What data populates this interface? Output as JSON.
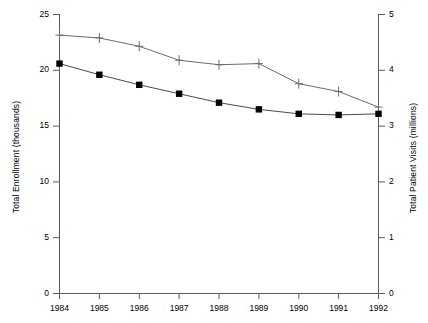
{
  "chart_data": {
    "type": "line",
    "title": "",
    "xlabel": "",
    "categories": [
      "1984",
      "1985",
      "1986",
      "1987",
      "1988",
      "1989",
      "1990",
      "1991",
      "1992"
    ],
    "x": [
      1984,
      1985,
      1986,
      1987,
      1988,
      1989,
      1990,
      1991,
      1992
    ],
    "grid": false,
    "legend_position": "none",
    "series": [
      {
        "name": "Total Patient Visits (millions)",
        "marker": "plus",
        "axis": "right",
        "color": "#555555",
        "values": [
          4.63,
          4.58,
          4.43,
          4.18,
          4.1,
          4.12,
          3.76,
          3.62,
          3.34
        ]
      },
      {
        "name": "Total Enrollment (thousands)",
        "marker": "filled-square",
        "axis": "left",
        "color": "#000000",
        "values": [
          20.6,
          19.6,
          18.7,
          17.9,
          17.1,
          16.5,
          16.1,
          16.0,
          16.1
        ]
      }
    ],
    "axes": {
      "left": {
        "label": "Total Enrollment (thousands)",
        "ticks": [
          "0",
          "5",
          "10",
          "15",
          "20",
          "25"
        ],
        "tick_values": [
          0,
          5,
          10,
          15,
          20,
          25
        ],
        "ylim": [
          0,
          25
        ]
      },
      "right": {
        "label": "Total Patient Visits (millions)",
        "ticks": [
          "0",
          "1",
          "2",
          "3",
          "4",
          "5"
        ],
        "tick_values": [
          0,
          1,
          2,
          3,
          4,
          5
        ],
        "ylim": [
          0,
          5
        ]
      },
      "bottom": {
        "label": "",
        "ticks": [
          "1984",
          "1985",
          "1986",
          "1987",
          "1988",
          "1989",
          "1990",
          "1991",
          "1992"
        ]
      }
    }
  }
}
